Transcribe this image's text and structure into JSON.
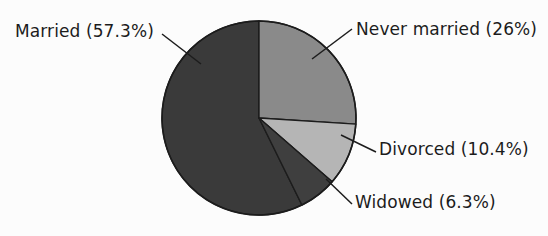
{
  "chart_data": {
    "type": "pie",
    "title": "",
    "subtitle": "",
    "xlabel": "",
    "ylabel": "",
    "legend_position": "callout-labels",
    "grid": false,
    "start_angle_deg": 0,
    "direction": "clockwise",
    "categories": [
      "Never married",
      "Divorced",
      "Widowed",
      "Married"
    ],
    "values": [
      26.0,
      10.4,
      6.3,
      57.3
    ],
    "unit": "percent",
    "labels": [
      "Never married (26%)",
      "Divorced (10.4%)",
      "Widowed (6.3%)",
      "Married (57.3%)"
    ],
    "slice_colors": [
      "#8a8a8a",
      "#b5b5b5",
      "#3f3f3f",
      "#3a3a3a"
    ],
    "annotations": [
      "Married (57.3%)",
      "Never married (26%)",
      "Divorced (10.4%)",
      "Widowed (6.3%)"
    ]
  },
  "chart": {
    "background_color": "#fcfcfc",
    "outline_color": "#1c1c1c",
    "leader_line_color": "#1c1c1c",
    "text_color": "#1c1c1c",
    "center_x": 259,
    "center_y": 118,
    "radius": 97,
    "slices": [
      {
        "key": "never-married",
        "name": "Never married",
        "value": 26.0,
        "percent_text": "26%",
        "label": "Never married (26%)",
        "color": "#8a8a8a",
        "start_angle_deg": 0,
        "end_angle_deg": 93.6
      },
      {
        "key": "divorced",
        "name": "Divorced",
        "value": 10.4,
        "percent_text": "10.4%",
        "label": "Divorced (10.4%)",
        "color": "#b5b5b5",
        "start_angle_deg": 93.6,
        "end_angle_deg": 131.04
      },
      {
        "key": "widowed",
        "name": "Widowed",
        "value": 6.3,
        "percent_text": "6.3%",
        "label": "Widowed (6.3%)",
        "color": "#3f3f3f",
        "start_angle_deg": 131.04,
        "end_angle_deg": 153.72
      },
      {
        "key": "married",
        "name": "Married",
        "value": 57.3,
        "percent_text": "57.3%",
        "label": "Married (57.3%)",
        "color": "#3a3a3a",
        "start_angle_deg": 153.72,
        "end_angle_deg": 360
      }
    ]
  }
}
